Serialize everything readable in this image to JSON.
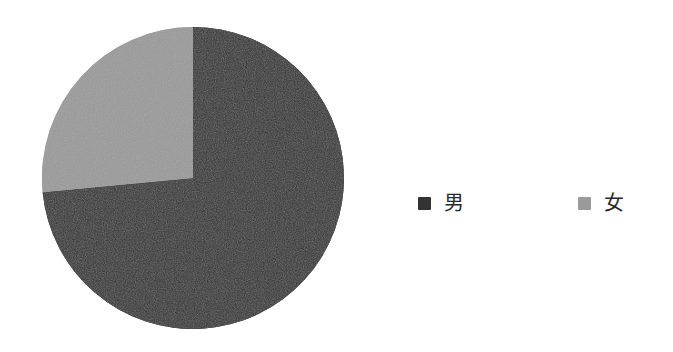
{
  "chart_data": {
    "type": "pie",
    "title": "",
    "subtitle": "",
    "xlabel": "",
    "ylabel": "",
    "grid": false,
    "legend_position": "right",
    "start_angle_deg": 0,
    "direction": "clockwise",
    "categories": [
      "男",
      "女"
    ],
    "values": [
      73.5,
      26.5
    ],
    "slices": [
      {
        "label": "男",
        "value": 73.5,
        "percent": "73.5%",
        "color": "#333333",
        "start_angle_deg": 0,
        "end_angle_deg": 264.6
      },
      {
        "label": "女",
        "value": 26.5,
        "percent": "26.5%",
        "color": "#9a9a9a",
        "start_angle_deg": 264.6,
        "end_angle_deg": 360
      }
    ],
    "legend": [
      {
        "label": "男",
        "color": "#333333"
      },
      {
        "label": "女",
        "color": "#9a9a9a"
      }
    ]
  },
  "figure": {
    "background": "#ffffff",
    "pie": {
      "center_x": 152,
      "center_y": 152,
      "radius": 151
    }
  }
}
